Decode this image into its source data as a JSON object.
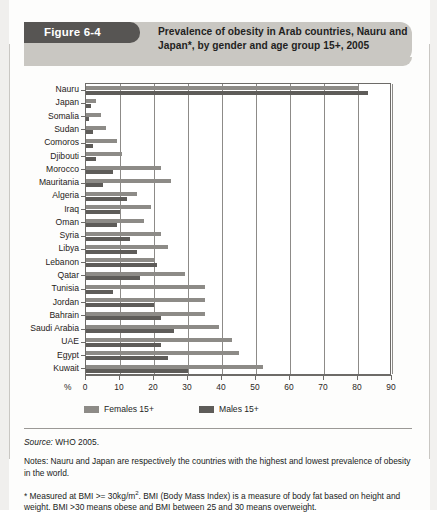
{
  "figure": {
    "badge": "Figure 6-4",
    "title": "Prevalence of obesity in Arab countries, Nauru and Japan*, by gender and age group 15+, 2005"
  },
  "axis": {
    "percent_symbol": "%",
    "ticks": [
      "0",
      "10",
      "20",
      "30",
      "40",
      "50",
      "60",
      "70",
      "80",
      "90"
    ]
  },
  "legend": {
    "females_label": "Females 15+",
    "males_label": "Males 15+",
    "females_color": "#8d8b87",
    "males_color": "#5e5c59"
  },
  "footer": {
    "source_label": "Source:",
    "source_text": " WHO 2005.",
    "notes": "Notes: Nauru and Japan are respectively the countries with the highest and lowest prevalence of obesity in the world.",
    "footnote_a": "* Measured at BMI >= 30kg/m",
    "footnote_sup": "2",
    "footnote_b": ". BMI (Body Mass Index) is a measure of body fat based on height and weight. BMI >30 means obese and BMI between 25 and 30 means overweight."
  },
  "chart_data": {
    "type": "bar",
    "orientation": "horizontal",
    "title": "Prevalence of obesity in Arab countries, Nauru and Japan*, by gender and age group 15+, 2005",
    "xlabel": "%",
    "ylabel": "",
    "xlim": [
      0,
      90
    ],
    "xticks": [
      0,
      10,
      20,
      30,
      40,
      50,
      60,
      70,
      80,
      90
    ],
    "grid": "vertical",
    "legend_position": "bottom-left",
    "categories": [
      "Nauru",
      "Japan",
      "Somalia",
      "Sudan",
      "Comoros",
      "Djibouti",
      "Morocco",
      "Mauritania",
      "Algeria",
      "Iraq",
      "Oman",
      "Syria",
      "Libya",
      "Lebanon",
      "Qatar",
      "Tunisia",
      "Jordan",
      "Bahrain",
      "Saudi Arabia",
      "UAE",
      "Egypt",
      "Kuwait"
    ],
    "series": [
      {
        "name": "Females 15+",
        "color": "#8d8b87",
        "values": [
          80.0,
          3.0,
          4.5,
          6.0,
          9.0,
          10.5,
          22.0,
          25.0,
          15.0,
          19.0,
          17.0,
          22.0,
          24.0,
          20.0,
          29.0,
          35.0,
          35.0,
          35.0,
          39.0,
          43.0,
          45.0,
          52.0
        ]
      },
      {
        "name": "Males 15+",
        "color": "#5e5c59",
        "values": [
          83.0,
          1.5,
          1.0,
          2.0,
          2.0,
          3.0,
          8.0,
          5.0,
          12.0,
          10.0,
          9.0,
          13.0,
          15.0,
          21.0,
          16.0,
          8.0,
          20.0,
          22.0,
          26.0,
          22.0,
          24.0,
          30.0
        ]
      }
    ]
  }
}
